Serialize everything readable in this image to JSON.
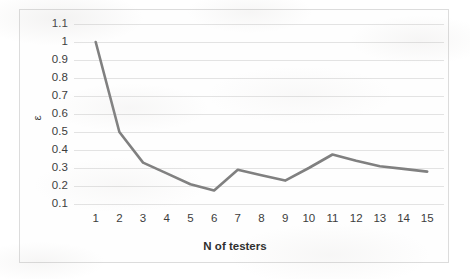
{
  "chart_data": {
    "type": "line",
    "title": "",
    "xlabel": "N of testers",
    "ylabel": "ε",
    "categories": [
      "1",
      "2",
      "3",
      "4",
      "5",
      "6",
      "7",
      "8",
      "9",
      "10",
      "11",
      "12",
      "13",
      "14",
      "15"
    ],
    "x": [
      1,
      2,
      3,
      4,
      5,
      6,
      7,
      8,
      9,
      10,
      11,
      12,
      13,
      14,
      15
    ],
    "values": [
      1.0,
      0.5,
      0.33,
      0.27,
      0.21,
      0.175,
      0.29,
      0.26,
      0.23,
      0.3,
      0.375,
      0.34,
      0.31,
      0.295,
      0.28
    ],
    "series": [
      {
        "name": "ε",
        "values": [
          1.0,
          0.5,
          0.33,
          0.27,
          0.21,
          0.175,
          0.29,
          0.26,
          0.23,
          0.3,
          0.375,
          0.34,
          0.31,
          0.295,
          0.28
        ],
        "color": "#808080"
      }
    ],
    "ylim": [
      0.0,
      1.15
    ],
    "ytick_labels": [
      "1.1",
      "1",
      "0.9",
      "0.8",
      "0.7",
      "0.6",
      "0.5",
      "0.4",
      "0.3",
      "0.2",
      "0.1"
    ],
    "ytick_values": [
      1.1,
      1.0,
      0.9,
      0.8,
      0.7,
      0.6,
      0.5,
      0.4,
      0.3,
      0.2,
      0.1
    ],
    "xtick_labels": [
      "1",
      "2",
      "3",
      "4",
      "5",
      "6",
      "7",
      "8",
      "9",
      "10",
      "11",
      "12",
      "13",
      "14",
      "15"
    ],
    "grid": {
      "horizontal": true,
      "vertical": false,
      "color": "#e3e3e3"
    },
    "legend": {
      "visible": false,
      "position": "none"
    },
    "line_color": "#808080",
    "line_width": 2.6,
    "markers": false,
    "plot_background": "#ffffff",
    "frame_border_color": "#dcdcdc"
  }
}
